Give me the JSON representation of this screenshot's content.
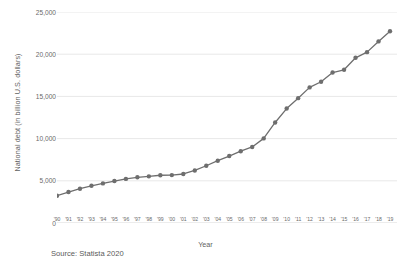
{
  "chart_data": {
    "type": "line",
    "title": "",
    "xlabel": "Year",
    "ylabel": "National debt (in billion U.S. dollars)",
    "categories": [
      "'90",
      "'91",
      "'92",
      "'93",
      "'94",
      "'95",
      "'96",
      "'97",
      "'98",
      "'99",
      "'00",
      "'01",
      "'02",
      "'03",
      "'04",
      "'05",
      "'06",
      "'07",
      "'08",
      "'09",
      "'10",
      "'11",
      "'12",
      "'13",
      "'14",
      "'15",
      "'16",
      "'17",
      "'18",
      "'19"
    ],
    "values": [
      3233,
      3665,
      4065,
      4411,
      4693,
      4974,
      5225,
      5413,
      5526,
      5656,
      5674,
      5807,
      6228,
      6783,
      7379,
      7933,
      8507,
      9008,
      10025,
      11910,
      13562,
      14790,
      16066,
      16738,
      17824,
      18151,
      19573,
      20245,
      21516,
      22719
    ],
    "ylim": [
      0,
      25000
    ],
    "yticks": [
      0,
      5000,
      10000,
      15000,
      20000,
      25000
    ],
    "ytick_labels": [
      "0",
      "5,000",
      "10,000",
      "15,000",
      "20,000",
      "25,000"
    ],
    "grid": true,
    "legend": "none",
    "line_color": "#6e6e6e",
    "marker_color": "#6e6e6e",
    "grid_color": "#e8e8e8",
    "axis_color": "#d9d9d9",
    "marker": "circle"
  },
  "source": {
    "text": "Source: Statista 2020"
  }
}
